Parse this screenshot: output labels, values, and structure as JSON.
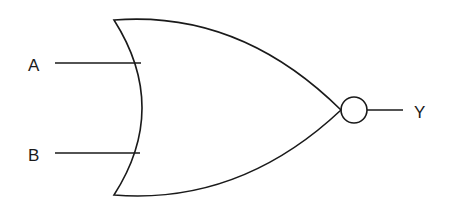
{
  "diagram": {
    "type": "logic-gate",
    "gate": "NOR",
    "inputs": [
      {
        "label": "A"
      },
      {
        "label": "B"
      }
    ],
    "output": {
      "label": "Y"
    },
    "colors": {
      "stroke": "#1a1a1a",
      "background": "#ffffff"
    }
  }
}
